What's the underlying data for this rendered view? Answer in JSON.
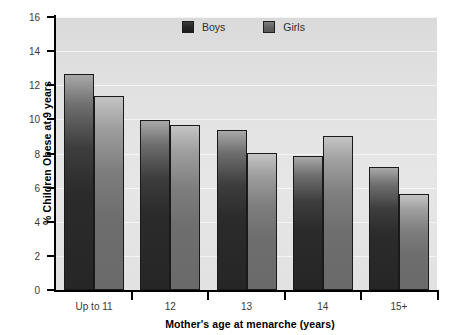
{
  "chart_data": {
    "type": "bar",
    "title": "",
    "subtitle": "",
    "xlabel": "Mother's age at menarche (years)",
    "ylabel": "% Children Obese at 9 years",
    "categories": [
      "Up to 11",
      "12",
      "13",
      "14",
      "15+"
    ],
    "series": [
      {
        "name": "Boys",
        "values": [
          12.65,
          9.95,
          9.4,
          7.85,
          7.2
        ],
        "color": "#262626"
      },
      {
        "name": "Girls",
        "values": [
          11.35,
          9.7,
          8.05,
          9.0,
          5.6
        ],
        "color": "#6e6e6e"
      }
    ],
    "ylim": [
      0,
      16
    ],
    "ytick_step": 2,
    "yticks": [
      0,
      2,
      4,
      6,
      8,
      10,
      12,
      14,
      16
    ],
    "ytick_labels": [
      "0",
      "2",
      "4",
      "6",
      "8",
      "10",
      "12",
      "14",
      "16"
    ],
    "grid": true,
    "grid_axis": "y",
    "legend_position": "top-center",
    "plot_background": "#e3e3e3",
    "gridline_color": "#f4f4f4",
    "axis_color": "#000000"
  },
  "legend": {
    "items": [
      {
        "label": "Boys",
        "swatch": "boys-swatch"
      },
      {
        "label": "Girls",
        "swatch": "girls-swatch"
      }
    ]
  },
  "axes": {
    "y_title": "% Children Obese at 9 years",
    "x_title": "Mother's age at menarche (years)"
  }
}
